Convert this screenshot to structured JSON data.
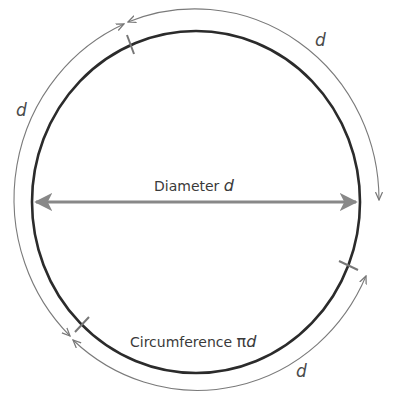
{
  "diagram": {
    "labels": {
      "diameter_text": "Diameter",
      "diameter_var": "d",
      "circumference_text": "Circumference",
      "circumference_pi": "π",
      "circumference_var": "d",
      "arc_top_left": "d",
      "arc_top_right": "d",
      "arc_bottom_right": "d"
    },
    "colors": {
      "circle": "#2b2b2b",
      "arc": "#7a7a7a",
      "diameter_arrow": "#888888",
      "tick": "#777777",
      "text": "#3a3a3a"
    },
    "geometry": {
      "center": [
        196,
        202
      ],
      "circle_radii": [
        164,
        171
      ],
      "arc_radii": [
        184,
        191
      ]
    }
  }
}
